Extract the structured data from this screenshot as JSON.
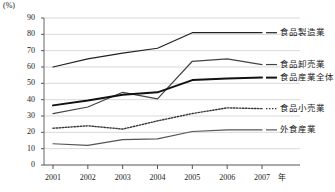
{
  "axis": {
    "unit_label": "(%)",
    "x_unit": "年",
    "y_ticks": [
      "90",
      "80",
      "70",
      "60",
      "50",
      "40",
      "30",
      "20",
      "10",
      "0"
    ],
    "x_ticks": [
      "2001",
      "2002",
      "2003",
      "2004",
      "2005",
      "2006",
      "2007"
    ]
  },
  "legend": {
    "items": [
      {
        "label": "食品製造業",
        "style": "solid-thin"
      },
      {
        "label": "食品卸売業",
        "style": "solid-thin"
      },
      {
        "label": "食品産業全体",
        "style": "solid-thick"
      },
      {
        "label": "食品小売業",
        "style": "dotted"
      },
      {
        "label": "外食産業",
        "style": "solid-thin"
      }
    ]
  },
  "chart_data": {
    "type": "line",
    "title": "",
    "xlabel": "年",
    "ylabel": "(%)",
    "ylim": [
      0,
      90
    ],
    "grid": true,
    "legend_position": "right",
    "categories": [
      "2001",
      "2002",
      "2003",
      "2004",
      "2005",
      "2006",
      "2007"
    ],
    "series": [
      {
        "name": "食品製造業",
        "values": [
          60.0,
          65.0,
          68.5,
          71.5,
          81.0,
          81.0,
          81.0
        ],
        "style": "solid-thin",
        "color": "#222222"
      },
      {
        "name": "食品卸売業",
        "values": [
          31.5,
          35.5,
          44.5,
          40.5,
          63.5,
          65.0,
          61.5
        ],
        "style": "solid-thin",
        "color": "#444444"
      },
      {
        "name": "食品産業全体",
        "values": [
          36.5,
          39.5,
          43.0,
          44.5,
          52.0,
          53.0,
          53.5
        ],
        "style": "solid-thick",
        "color": "#111111"
      },
      {
        "name": "食品小売業",
        "values": [
          22.5,
          24.0,
          22.0,
          27.0,
          31.5,
          35.0,
          34.5
        ],
        "style": "dotted",
        "color": "#333333"
      },
      {
        "name": "外食産業",
        "values": [
          13.0,
          12.0,
          15.5,
          16.0,
          20.5,
          21.5,
          21.5
        ],
        "style": "solid-thin",
        "color": "#555555"
      }
    ]
  }
}
